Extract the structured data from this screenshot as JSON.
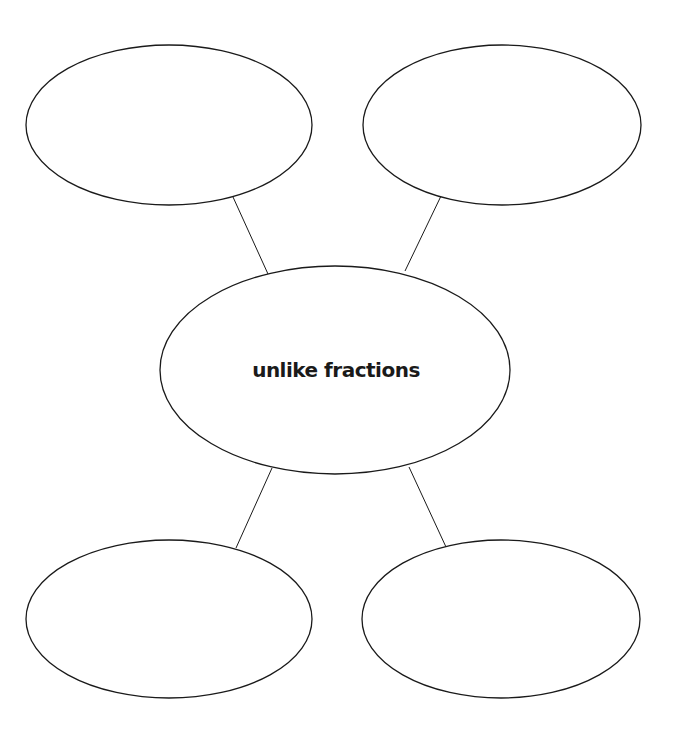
{
  "diagram": {
    "type": "concept-web",
    "center": {
      "label": "unlike fractions",
      "cx": 335,
      "cy": 370,
      "rx": 175,
      "ry": 104
    },
    "nodes": [
      {
        "id": "top-left",
        "label": "",
        "cx": 169,
        "cy": 125,
        "rx": 143,
        "ry": 80
      },
      {
        "id": "top-right",
        "label": "",
        "cx": 502,
        "cy": 125,
        "rx": 139,
        "ry": 80
      },
      {
        "id": "bottom-left",
        "label": "",
        "cx": 169,
        "cy": 619,
        "rx": 143,
        "ry": 79
      },
      {
        "id": "bottom-right",
        "label": "",
        "cx": 501,
        "cy": 619,
        "rx": 139,
        "ry": 79
      }
    ],
    "edges": [
      {
        "from": "center",
        "to": "top-left",
        "x1": 268,
        "y1": 274,
        "x2": 233,
        "y2": 197
      },
      {
        "from": "center",
        "to": "top-right",
        "x1": 405,
        "y1": 271,
        "x2": 441,
        "y2": 196
      },
      {
        "from": "center",
        "to": "bottom-left",
        "x1": 272,
        "y1": 468,
        "x2": 236,
        "y2": 548
      },
      {
        "from": "center",
        "to": "bottom-right",
        "x1": 409,
        "y1": 467,
        "x2": 446,
        "y2": 547
      }
    ],
    "colors": {
      "stroke": "#1a1a1a",
      "fill": "#ffffff",
      "background": "#ffffff"
    }
  }
}
